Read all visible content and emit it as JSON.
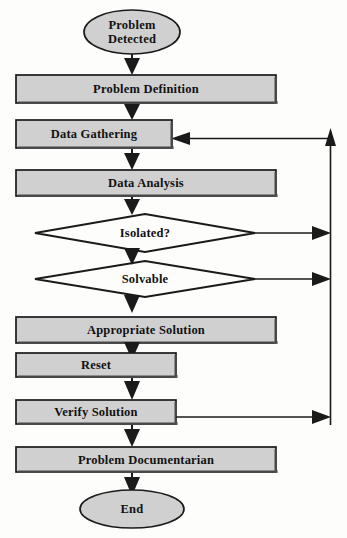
{
  "diagram": {
    "type": "flowchart",
    "background_color": "#fdfdfc",
    "node_fill_color": "#d0d0d0",
    "node_stroke_color": "#1a1a1a",
    "connector_color": "#1a1a1a"
  },
  "nodes": {
    "start": {
      "label": "Problem\nDetected",
      "line1": "Problem",
      "line2": "Detected",
      "shape": "ellipse"
    },
    "problem_definition": {
      "label": "Problem Definition",
      "shape": "process"
    },
    "data_gathering": {
      "label": "Data Gathering",
      "shape": "process"
    },
    "data_analysis": {
      "label": "Data Analysis",
      "shape": "process"
    },
    "isolated": {
      "label": "Isolated?",
      "shape": "decision"
    },
    "solvable": {
      "label": "Solvable",
      "shape": "decision"
    },
    "appropriate_solution": {
      "label": "Appropriate Solution",
      "shape": "process"
    },
    "reset": {
      "label": "Reset",
      "shape": "process"
    },
    "verify_solution": {
      "label": "Verify Solution",
      "shape": "process"
    },
    "problem_documentarian": {
      "label": "Problem Documentarian",
      "shape": "process"
    },
    "end": {
      "label": "End",
      "shape": "ellipse"
    }
  },
  "edges": [
    {
      "from": "start",
      "to": "problem_definition",
      "label": ""
    },
    {
      "from": "problem_definition",
      "to": "data_gathering",
      "label": ""
    },
    {
      "from": "data_gathering",
      "to": "data_analysis",
      "label": ""
    },
    {
      "from": "data_analysis",
      "to": "isolated",
      "label": ""
    },
    {
      "from": "isolated",
      "to": "solvable",
      "label": ""
    },
    {
      "from": "solvable",
      "to": "appropriate_solution",
      "label": ""
    },
    {
      "from": "appropriate_solution",
      "to": "reset",
      "label": ""
    },
    {
      "from": "reset",
      "to": "verify_solution",
      "label": ""
    },
    {
      "from": "verify_solution",
      "to": "problem_documentarian",
      "label": ""
    },
    {
      "from": "problem_documentarian",
      "to": "end",
      "label": ""
    },
    {
      "from": "isolated",
      "to": "feedback_bus",
      "label": ""
    },
    {
      "from": "solvable",
      "to": "feedback_bus",
      "label": ""
    },
    {
      "from": "verify_solution",
      "to": "feedback_bus",
      "label": ""
    },
    {
      "from": "feedback_bus",
      "to": "data_gathering",
      "label": ""
    }
  ]
}
